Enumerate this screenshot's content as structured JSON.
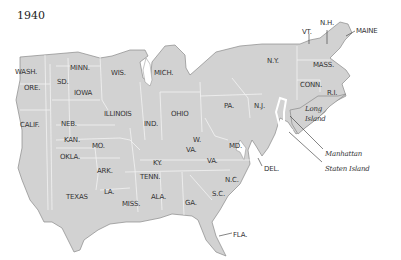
{
  "map": {
    "title": "1940",
    "colors": {
      "land": "#d2d2d2",
      "border": "#f2f2f2",
      "coast": "#8a8a8a",
      "water": "#ffffff",
      "text": "#333333"
    },
    "states": [
      {
        "label": "WASH.",
        "x": 15,
        "y": 69
      },
      {
        "label": "ORE.",
        "x": 24,
        "y": 85
      },
      {
        "label": "CALIF.",
        "x": 20,
        "y": 122
      },
      {
        "label": "SD.",
        "x": 57,
        "y": 79
      },
      {
        "label": "MINN.",
        "x": 70,
        "y": 65
      },
      {
        "label": "IOWA",
        "x": 74,
        "y": 90
      },
      {
        "label": "WIS.",
        "x": 111,
        "y": 70
      },
      {
        "label": "MICH.",
        "x": 154,
        "y": 70
      },
      {
        "label": "ILLINOIS",
        "x": 104,
        "y": 111
      },
      {
        "label": "IND.",
        "x": 144,
        "y": 121
      },
      {
        "label": "OHIO",
        "x": 171,
        "y": 111
      },
      {
        "label": "NEB.",
        "x": 61,
        "y": 121
      },
      {
        "label": "KAN.",
        "x": 64,
        "y": 137
      },
      {
        "label": "MO.",
        "x": 92,
        "y": 143
      },
      {
        "label": "OKLA.",
        "x": 60,
        "y": 154
      },
      {
        "label": "ARK.",
        "x": 97,
        "y": 168
      },
      {
        "label": "TEXAS",
        "x": 66,
        "y": 194
      },
      {
        "label": "LA.",
        "x": 104,
        "y": 189
      },
      {
        "label": "MISS.",
        "x": 122,
        "y": 201
      },
      {
        "label": "ALA.",
        "x": 151,
        "y": 194
      },
      {
        "label": "TENN.",
        "x": 140,
        "y": 174
      },
      {
        "label": "KY.",
        "x": 153,
        "y": 160
      },
      {
        "label": "W.",
        "x": 193,
        "y": 137
      },
      {
        "label": "VA.",
        "x": 186,
        "y": 147
      },
      {
        "label": "VA.",
        "x": 207,
        "y": 158
      },
      {
        "label": "GA.",
        "x": 185,
        "y": 200
      },
      {
        "label": "S.C.",
        "x": 212,
        "y": 191
      },
      {
        "label": "N.C.",
        "x": 225,
        "y": 177
      },
      {
        "label": "MD.",
        "x": 229,
        "y": 143
      },
      {
        "label": "DEL.",
        "x": 264,
        "y": 166
      },
      {
        "label": "FLA.",
        "x": 233,
        "y": 232
      },
      {
        "label": "PA.",
        "x": 224,
        "y": 103
      },
      {
        "label": "N.J.",
        "x": 254,
        "y": 103
      },
      {
        "label": "N.Y.",
        "x": 267,
        "y": 58
      },
      {
        "label": "VT.",
        "x": 302,
        "y": 29
      },
      {
        "label": "N.H.",
        "x": 320,
        "y": 20
      },
      {
        "label": "MAINE",
        "x": 356,
        "y": 28
      },
      {
        "label": "MASS.",
        "x": 313,
        "y": 62
      },
      {
        "label": "CONN.",
        "x": 300,
        "y": 82
      },
      {
        "label": "R.I.",
        "x": 327,
        "y": 90
      }
    ],
    "places": [
      {
        "label": "Long Island",
        "x": 305,
        "y": 104
      },
      {
        "label": "Manhattan",
        "x": 325,
        "y": 151
      },
      {
        "label": "Staten Island",
        "x": 325,
        "y": 166
      }
    ]
  }
}
